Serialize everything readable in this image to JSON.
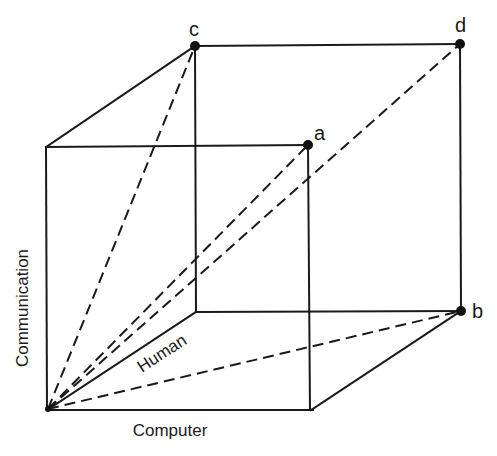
{
  "diagram": {
    "type": "3D cube with labeled axes and diagonal vectors from origin",
    "axes": {
      "x": "Computer",
      "y": "Communication",
      "z": "Human"
    },
    "points": [
      {
        "label": "a",
        "description": "front top-right corner"
      },
      {
        "label": "b",
        "description": "back bottom-right corner"
      },
      {
        "label": "c",
        "description": "back top-left corner"
      },
      {
        "label": "d",
        "description": "back top-right corner (opposite origin)"
      }
    ],
    "dashed_vectors_from_origin_to": [
      "a",
      "b",
      "c",
      "d"
    ],
    "colors": {
      "line": "#1a1a1a",
      "background": "#ffffff"
    }
  }
}
